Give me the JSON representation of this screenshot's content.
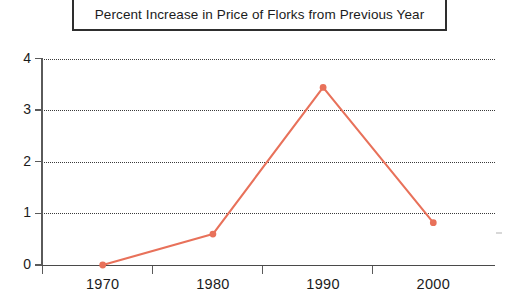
{
  "chart_data": {
    "type": "line",
    "title": "Percent Increase in Price of Florks from Previous Year",
    "xlabel": "",
    "ylabel": "",
    "categories": [
      "1970",
      "1980",
      "1990",
      "2000"
    ],
    "values": [
      0.0,
      0.6,
      3.44,
      0.82
    ],
    "series": [
      {
        "name": "Percent Increase",
        "values": [
          0.0,
          0.6,
          3.44,
          0.82
        ]
      }
    ],
    "x": [
      1970,
      1980,
      1990,
      2000
    ],
    "ylim": [
      0,
      4
    ],
    "yticks": [
      "0",
      "1",
      "2",
      "3",
      "4"
    ],
    "ytick_values": [
      0,
      1,
      2,
      3,
      4
    ],
    "xticks": [
      "1970",
      "1980",
      "1990",
      "2000"
    ],
    "grid": "horizontal-dotted",
    "legend": "none",
    "colors": {
      "line": "#e8715a",
      "marker": "#e8715a",
      "axis": "#4a4a4a",
      "grid": "#3a3a3a",
      "text": "#1b1b1b",
      "title_border": "#2e2e2e",
      "background": "#ffffff"
    }
  },
  "title": {
    "text": "Percent Increase in Price of Florks from Previous Year"
  },
  "yaxis": {
    "labels": [
      "0",
      "1",
      "2",
      "3",
      "4"
    ]
  },
  "xaxis": {
    "labels": [
      "1970",
      "1980",
      "1990",
      "2000"
    ]
  }
}
